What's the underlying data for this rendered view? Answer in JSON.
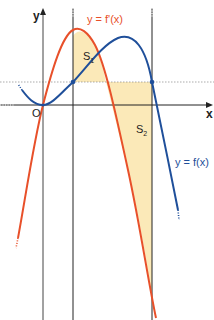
{
  "diagram": {
    "axes": {
      "x_label": "x",
      "y_label": "y",
      "origin_label": "O"
    },
    "curves": [
      {
        "name": "f-prime",
        "label": "y = f'(x)",
        "color": "#e8502a"
      },
      {
        "name": "f",
        "label": "y = f(x)",
        "color": "#1f4f9a"
      }
    ],
    "regions": [
      {
        "name": "S1",
        "label": "S",
        "subscript": "1",
        "fill": "#fbe7b0"
      },
      {
        "name": "S2",
        "label": "S",
        "subscript": "2",
        "fill": "#fbe7b0"
      }
    ],
    "colors": {
      "axis": "#222222",
      "guide": "#555555",
      "dashed": "#888888",
      "region_fill": "#fbe7b0"
    }
  }
}
